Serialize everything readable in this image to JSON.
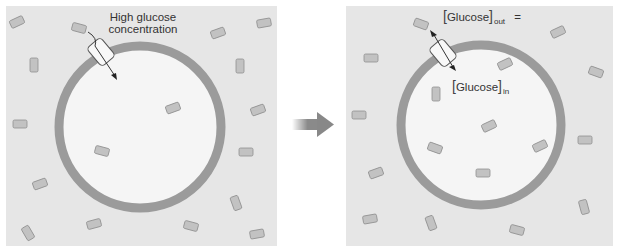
{
  "colors": {
    "panel_bg": "#e6e6e6",
    "cell_interior": "#f5f5f5",
    "membrane": "#9b9b9b",
    "glucose": "#c2c2c2",
    "glucose_stroke": "#8f8f8f",
    "arrow": "#8a8a8a"
  },
  "left_panel": {
    "label_line1": "High glucose",
    "label_line2": "concentration"
  },
  "right_panel": {
    "label_out_main": "Glucose",
    "label_out_sub": "out",
    "equals": "=",
    "label_in_main": "Glucose",
    "label_in_sub": "in"
  },
  "transition_arrow": "right-arrow-icon"
}
